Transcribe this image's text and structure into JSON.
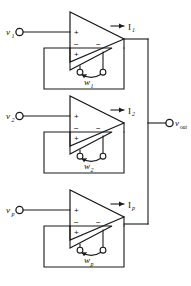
{
  "figure": {
    "type": "circuit-schematic",
    "line_color": "#1a1a1a",
    "background_color": "#ffffff",
    "stage_count": 3
  },
  "stages": [
    {
      "id": "stage-1",
      "input_label": "v",
      "input_subscript": "1",
      "current_label": "I",
      "current_subscript": "1",
      "weight_label": "w",
      "weight_subscript": "1",
      "amp_plus": "+",
      "amp_minus": "−",
      "inner_minus": "−",
      "inner_plus": "+"
    },
    {
      "id": "stage-2",
      "input_label": "v",
      "input_subscript": "2",
      "current_label": "I",
      "current_subscript": "2",
      "weight_label": "w",
      "weight_subscript": "2",
      "amp_plus": "+",
      "amp_minus": "−",
      "inner_minus": "−",
      "inner_plus": "+"
    },
    {
      "id": "stage-3",
      "input_label": "v",
      "input_subscript": "p",
      "current_label": "I",
      "current_subscript": "p",
      "weight_label": "w",
      "weight_subscript": "p",
      "amp_plus": "+",
      "amp_minus": "−",
      "inner_minus": "−",
      "inner_plus": "+"
    }
  ],
  "output": {
    "label": "v",
    "subscript": "out"
  }
}
